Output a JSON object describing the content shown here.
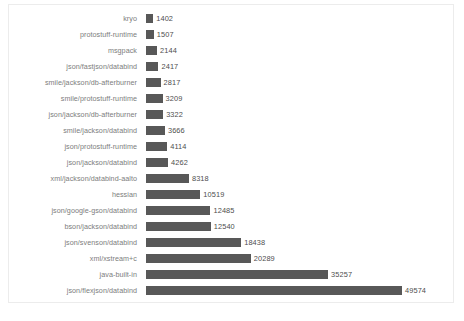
{
  "chart_data": {
    "type": "bar",
    "orientation": "horizontal",
    "title": "",
    "subtitle": "",
    "xlabel": "",
    "ylabel": "",
    "grid": false,
    "legend": "none",
    "axis_ticks_visible": false,
    "value_labels_visible": true,
    "sort_order": "ascending-top-to-bottom",
    "xlim": [
      0,
      49574
    ],
    "bar_color": "#585858",
    "label_color": "#7d7d7d",
    "value_color": "#4e4e4e",
    "background_color": "#ffffff",
    "border_color": "#ececec",
    "categories": [
      "kryo",
      "protostuff-runtime",
      "msgpack",
      "json/fastjson/databind",
      "smile/jackson/db-afterburner",
      "smile/protostuff-runtime",
      "json/jackson/db-afterburner",
      "smile/jackson/databind",
      "json/protostuff-runtime",
      "json/jackson/databind",
      "xml/jackson/databind-aalto",
      "hessian",
      "json/google-gson/databind",
      "bson/jackson/databind",
      "json/svenson/databind",
      "xml/xstream+c",
      "java-built-in",
      "json/flexjson/databind"
    ],
    "values": [
      1402,
      1507,
      2144,
      2417,
      2817,
      3209,
      3322,
      3666,
      4114,
      4262,
      8318,
      10519,
      12485,
      12540,
      18438,
      20289,
      35257,
      49574
    ],
    "value_labels": [
      "1402",
      "1507",
      "2144",
      "2417",
      "2817",
      "3209",
      "3322",
      "3666",
      "4114",
      "4262",
      "8318",
      "10519",
      "12485",
      "12540",
      "18438",
      "20289",
      "35257",
      "49574"
    ]
  }
}
